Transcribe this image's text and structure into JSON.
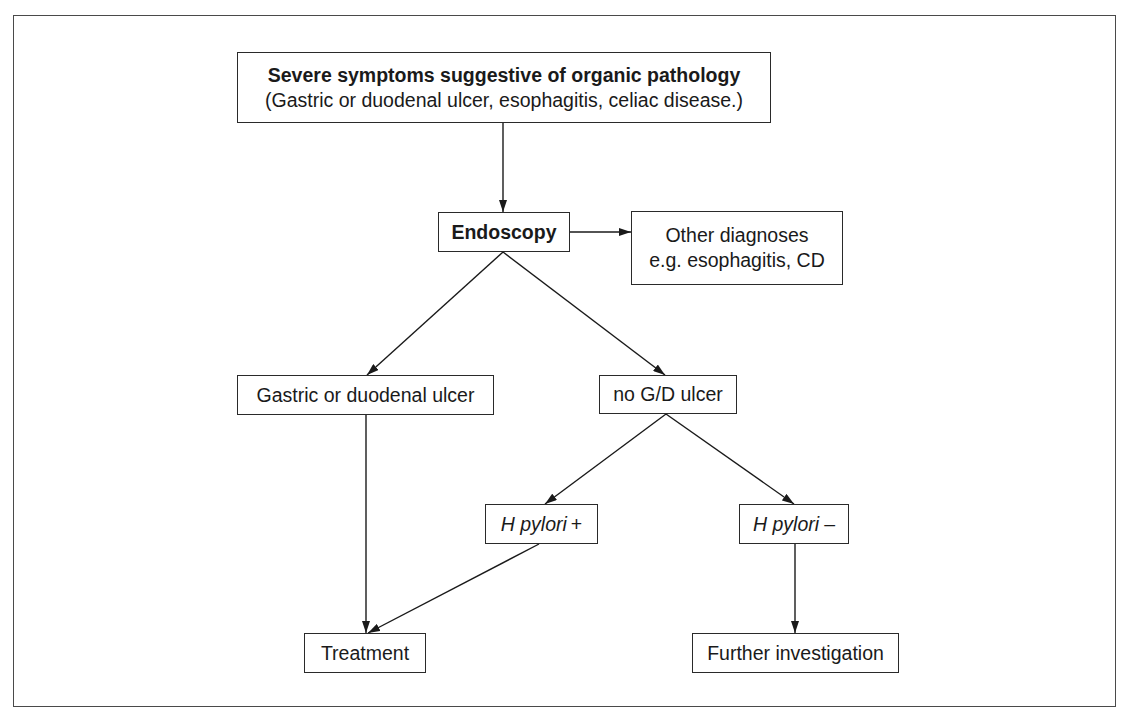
{
  "diagram": {
    "type": "flowchart",
    "nodes": {
      "severe": {
        "title": "Severe symptoms suggestive of organic pathology",
        "subtitle": "(Gastric or duodenal ulcer, esophagitis, celiac disease.)"
      },
      "endoscopy": {
        "label": "Endoscopy"
      },
      "other": {
        "line1": "Other diagnoses",
        "line2": "e.g. esophagitis, CD"
      },
      "gastric": {
        "label": "Gastric or duodenal ulcer"
      },
      "no_gd": {
        "label": "no G/D ulcer"
      },
      "hp_pos": {
        "italic": "H pylori",
        "sign": "+"
      },
      "hp_neg": {
        "italic": "H pylori",
        "sign": "–"
      },
      "treatment": {
        "label": "Treatment"
      },
      "further": {
        "label": "Further investigation"
      }
    },
    "edges": [
      {
        "from": "severe",
        "to": "endoscopy"
      },
      {
        "from": "endoscopy",
        "to": "other"
      },
      {
        "from": "endoscopy",
        "to": "gastric"
      },
      {
        "from": "endoscopy",
        "to": "no_gd"
      },
      {
        "from": "no_gd",
        "to": "hp_pos"
      },
      {
        "from": "no_gd",
        "to": "hp_neg"
      },
      {
        "from": "gastric",
        "to": "treatment"
      },
      {
        "from": "hp_pos",
        "to": "treatment"
      },
      {
        "from": "hp_neg",
        "to": "further"
      }
    ]
  }
}
